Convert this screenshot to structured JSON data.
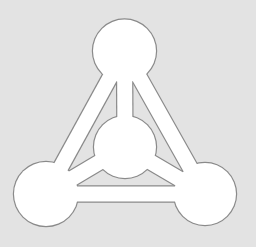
{
  "icon": {
    "semantic": "network-graph-icon",
    "colors": {
      "background": "#e3e3e3",
      "fill": "#ffffff",
      "outline": "#8a8a8a"
    },
    "bar_width": 15,
    "nodes": [
      {
        "id": "top",
        "cx": 124.5,
        "cy": 51,
        "r": 31.5
      },
      {
        "id": "center",
        "cx": 125,
        "cy": 147,
        "r": 31
      },
      {
        "id": "bottom-left",
        "cx": 46,
        "cy": 194,
        "r": 32
      },
      {
        "id": "bottom-right",
        "cx": 205,
        "cy": 194,
        "r": 31
      }
    ],
    "edges": [
      [
        "top",
        "center"
      ],
      [
        "top",
        "bottom-left"
      ],
      [
        "top",
        "bottom-right"
      ],
      [
        "center",
        "bottom-left"
      ],
      [
        "center",
        "bottom-right"
      ],
      [
        "bottom-left",
        "bottom-right"
      ]
    ]
  }
}
